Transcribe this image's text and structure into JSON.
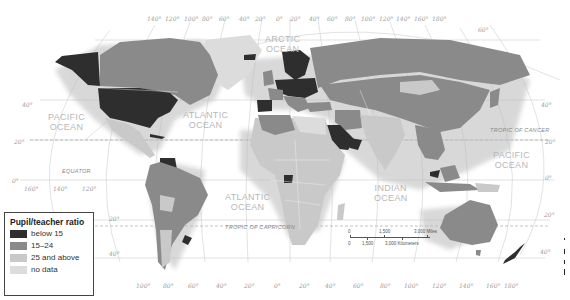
{
  "map": {
    "type": "choropleth world map",
    "theme": "Pupil/teacher ratio by country",
    "colors": {
      "below_15": "#2e2e2e",
      "15_24": "#8a8a8a",
      "25_and_above": "#c9c9c9",
      "no_data": "#dcdcdc",
      "ocean": "#ffffff",
      "graticule": "#c8c8c8"
    }
  },
  "legend": {
    "title": "Pupil/teacher ratio",
    "items": [
      {
        "label": "below 15",
        "color": "#2e2e2e"
      },
      {
        "label": "15–24",
        "color": "#8a8a8a"
      },
      {
        "label": "25 and above",
        "color": "#c9c9c9"
      },
      {
        "label": "no data",
        "color": "#dcdcdc"
      }
    ]
  },
  "oceans": {
    "arctic": [
      "ARCTIC",
      "OCEAN"
    ],
    "pacific_west": [
      "PACIFIC",
      "OCEAN"
    ],
    "atlantic_north": [
      "ATLANTIC",
      "OCEAN"
    ],
    "atlantic_south": [
      "ATLANTIC",
      "OCEAN"
    ],
    "indian": [
      "INDIAN",
      "OCEAN"
    ],
    "pacific_east": [
      "PACIFIC",
      "OCEAN"
    ]
  },
  "lines": {
    "equator": "EQUATOR",
    "tropic_cancer": "TROPIC OF CANCER",
    "tropic_capricorn": "TROPIC OF CAPRICORN"
  },
  "top_longitudes": [
    "140°",
    "120°",
    "100°",
    "80°",
    "60°",
    "40°",
    "20°",
    "0°",
    "20°",
    "40°",
    "60°",
    "80°",
    "100°",
    "120°",
    "140°",
    "160°",
    "180°"
  ],
  "bottom_longitudes": [
    "100°",
    "80°",
    "60°",
    "40°",
    "20°",
    "0°",
    "20°",
    "40°",
    "60°",
    "80°",
    "100°",
    "120°",
    "140°",
    "160°",
    "180°"
  ],
  "left_longitudes": [
    "160°",
    "140°",
    "120°"
  ],
  "left_latitudes": [
    "40°",
    "20°",
    "0°",
    "20°",
    "40°"
  ],
  "right_latitudes": [
    "60°",
    "40°",
    "20°",
    "0°",
    "20°",
    "40°"
  ],
  "scale": {
    "miles": [
      "0",
      "1,500",
      "3,000 Miles"
    ],
    "kilometers": [
      "0",
      "1,500",
      "3,000 Kilometers"
    ]
  }
}
